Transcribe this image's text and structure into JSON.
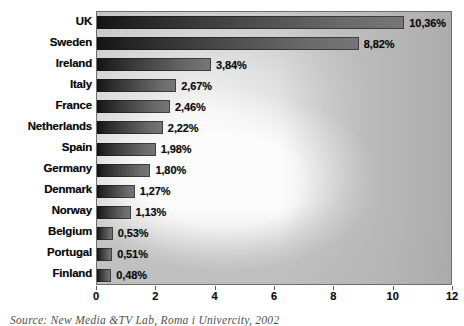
{
  "chart_data": {
    "type": "bar",
    "orientation": "horizontal",
    "title": "",
    "xlabel": "",
    "ylabel": "",
    "xlim": [
      0,
      12
    ],
    "xticks": [
      0,
      2,
      4,
      6,
      8,
      10,
      12
    ],
    "xtick_labels": [
      "0",
      "2",
      "4",
      "6",
      "8",
      "10",
      "12"
    ],
    "grid": false,
    "legend": null,
    "value_suffix": "%",
    "decimal_separator": ",",
    "categories": [
      "UK",
      "Sweden",
      "Ireland",
      "Italy",
      "France",
      "Netherlands",
      "Spain",
      "Germany",
      "Denmark",
      "Norway",
      "Belgium",
      "Portugal",
      "Finland"
    ],
    "values": [
      10.36,
      8.82,
      3.84,
      2.67,
      2.46,
      2.22,
      1.98,
      1.8,
      1.27,
      1.13,
      0.53,
      0.51,
      0.48
    ],
    "value_labels": [
      "10,36%",
      "8,82%",
      "3,84%",
      "2,67%",
      "2,46%",
      "2,22%",
      "1,98%",
      "1,80%",
      "1,27%",
      "1,13%",
      "0,53%",
      "0,51%",
      "0,48%"
    ]
  },
  "bars": [
    {
      "category": "UK",
      "value": 10.36,
      "label": "10,36%"
    },
    {
      "category": "Sweden",
      "value": 8.82,
      "label": "8,82%"
    },
    {
      "category": "Ireland",
      "value": 3.84,
      "label": "3,84%"
    },
    {
      "category": "Italy",
      "value": 2.67,
      "label": "2,67%"
    },
    {
      "category": "France",
      "value": 2.46,
      "label": "2,46%"
    },
    {
      "category": "Netherlands",
      "value": 2.22,
      "label": "2,22%"
    },
    {
      "category": "Spain",
      "value": 1.98,
      "label": "1,98%"
    },
    {
      "category": "Germany",
      "value": 1.8,
      "label": "1,80%"
    },
    {
      "category": "Denmark",
      "value": 1.27,
      "label": "1,27%"
    },
    {
      "category": "Norway",
      "value": 1.13,
      "label": "1,13%"
    },
    {
      "category": "Belgium",
      "value": 0.53,
      "label": "0,53%"
    },
    {
      "category": "Portugal",
      "value": 0.51,
      "label": "0,51%"
    },
    {
      "category": "Finland",
      "value": 0.48,
      "label": "0,48%"
    }
  ],
  "axis": {
    "ticks": [
      "0",
      "2",
      "4",
      "6",
      "8",
      "10",
      "12"
    ]
  },
  "caption": {
    "text": "Source: New Media &TV Lab, Roma i Univercity, 2002"
  },
  "colors": {
    "bar_dark": "#141414",
    "bar_light": "#767676",
    "plot_border": "#6e6e6e",
    "plot_bg": "#c9c9c9",
    "text": "#0b0b0b"
  }
}
